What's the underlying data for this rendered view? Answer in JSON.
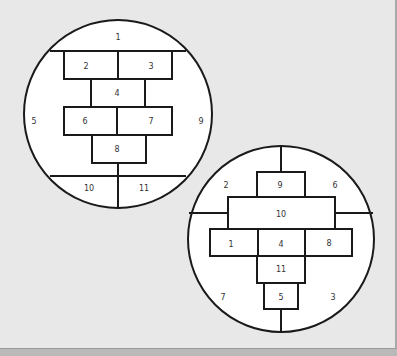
{
  "figure": {
    "background_color": "#e8e8e8",
    "line_color": "#1a1a1a",
    "fill_color": "#ffffff",
    "text_color": "#333333"
  },
  "circle_a": {
    "labels": {
      "top": "1",
      "box_top_left": "2",
      "box_top_right": "3",
      "box_middle": "4",
      "left": "5",
      "box_mid_left": "6",
      "box_mid_right": "7",
      "box_bottom": "8",
      "right": "9",
      "bottom_left": "10",
      "bottom_right": "11"
    }
  },
  "circle_b": {
    "labels": {
      "box_row2_left": "1",
      "top_left": "2",
      "bottom_right": "3",
      "box_row2_center": "4",
      "box_bottom": "5",
      "top_right": "6",
      "bottom_left": "7",
      "box_row2_right": "8",
      "box_top": "9",
      "box_wide": "10",
      "box_row3": "11"
    }
  }
}
